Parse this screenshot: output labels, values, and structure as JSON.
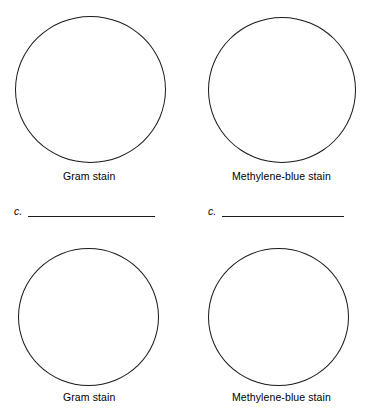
{
  "worksheet": {
    "title": "Bacterial stain observation worksheet",
    "background_color": "#ffffff",
    "ink_color": "#1a1a1a"
  },
  "panels": [
    {
      "id": "top-left",
      "drawing_area": "empty-circle",
      "caption": "Gram stain"
    },
    {
      "id": "top-right",
      "drawing_area": "empty-circle",
      "caption": "Methylene-blue stain"
    },
    {
      "id": "bottom-left",
      "drawing_area": "empty-circle",
      "caption": "Gram stain"
    },
    {
      "id": "bottom-right",
      "drawing_area": "empty-circle",
      "caption": "Methylene-blue stain"
    }
  ],
  "answer_rows": [
    {
      "id": "left",
      "label": "c.",
      "value": "",
      "placeholder": ""
    },
    {
      "id": "right",
      "label": "c.",
      "value": "",
      "placeholder": ""
    }
  ]
}
